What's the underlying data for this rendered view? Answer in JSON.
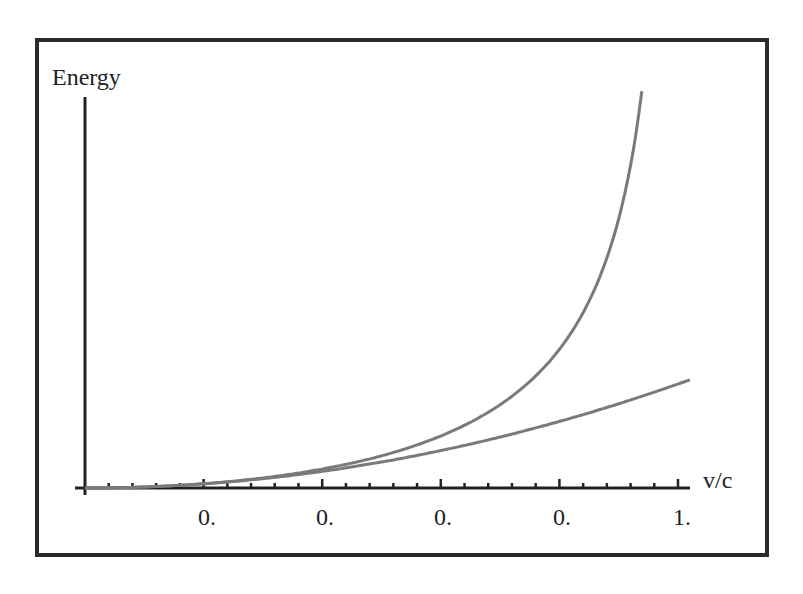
{
  "chart_data": {
    "type": "line",
    "title": "",
    "xlabel": "v/c",
    "ylabel": "Energy",
    "xlim": [
      0,
      1.02
    ],
    "x_ticks": [
      0.2,
      0.4,
      0.6,
      0.8,
      1.0
    ],
    "x_tick_labels": [
      "0.",
      "0.",
      "0.",
      "0.",
      "1."
    ],
    "minor_ticks_per_major": 5,
    "grid": false,
    "legend": null,
    "series": [
      {
        "name": "relativistic kinetic energy",
        "formula": "(1/sqrt(1-(v/c)^2) - 1)",
        "x": [
          0.0,
          0.2,
          0.4,
          0.6,
          0.7,
          0.8,
          0.85,
          0.9,
          0.939
        ],
        "values": [
          0.0,
          0.021,
          0.091,
          0.25,
          0.4,
          0.667,
          0.898,
          1.294,
          1.91
        ]
      },
      {
        "name": "classical kinetic energy",
        "formula": "0.5*(v/c)^2",
        "x": [
          0.0,
          0.2,
          0.4,
          0.6,
          0.8,
          1.0,
          1.02
        ],
        "values": [
          0.0,
          0.02,
          0.08,
          0.18,
          0.32,
          0.5,
          0.52
        ]
      }
    ]
  },
  "axes": {
    "y_label": "Energy",
    "x_label": "v/c",
    "tick_labels": [
      "0.",
      "0.",
      "0.",
      "0.",
      "1."
    ]
  },
  "colors": {
    "curve": "#7a7a7a",
    "axis": "#222222",
    "frame": "#2a2a2a"
  }
}
